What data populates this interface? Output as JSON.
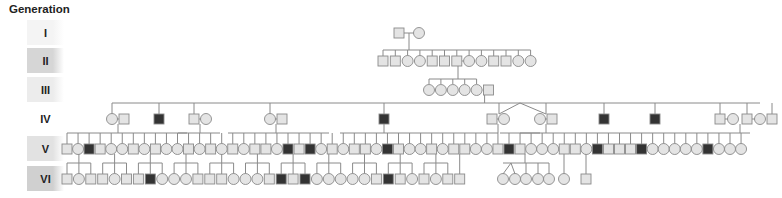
{
  "title": "Generation",
  "colors": {
    "unaffected_fill": "#e4e4e4",
    "affected_fill": "#333333",
    "line": "#8a8a8a"
  },
  "generations": [
    {
      "label": "I",
      "shade": "#f4f4f4"
    },
    {
      "label": "II",
      "shade": "#d6d6d6"
    },
    {
      "label": "III",
      "shade": "#ececec"
    },
    {
      "label": "IV",
      "shade": "#ffffff"
    },
    {
      "label": "V",
      "shade": "#e2e2e2"
    },
    {
      "label": "VI",
      "shade": "#d0d0d0"
    }
  ],
  "legend": {
    "square": "male",
    "circle": "female",
    "filled": "affected",
    "open": "unaffected"
  },
  "pedigree": {
    "gen_I": [
      "M",
      "F"
    ],
    "gen_II": [
      "M",
      "M",
      "F",
      "F",
      "M",
      "M",
      "M",
      "F",
      "F",
      "M",
      "M",
      "F",
      "F"
    ],
    "gen_III": [
      "F",
      "F",
      "F",
      "F",
      "F",
      "M"
    ],
    "gen_IV": [
      "F",
      "M",
      "A",
      "M",
      "F",
      "F",
      "M",
      "A",
      "M",
      "F",
      "F",
      "M",
      "A",
      "A",
      "M",
      "F",
      "M",
      "F",
      "M"
    ],
    "gen_V_row": [
      "M",
      "F",
      "A",
      "M",
      "F",
      "F",
      "M",
      "F",
      "M",
      "F",
      "F",
      "M",
      "F",
      "M",
      "F",
      "M",
      "F",
      "M",
      "M",
      "F",
      "A",
      "M",
      "A",
      "F",
      "M",
      "F",
      "M",
      "M",
      "F",
      "A",
      "M",
      "F",
      "F",
      "M",
      "F",
      "M",
      "M",
      "F",
      "F",
      "M",
      "A",
      "M",
      "F",
      "F",
      "F",
      "M",
      "M",
      "F",
      "A",
      "M",
      "M",
      "M",
      "A",
      "F",
      "F",
      "F",
      "F",
      "F",
      "A",
      "F",
      "F",
      "F"
    ],
    "gen_VI_row": [
      "M",
      "F",
      "M",
      "M",
      "F",
      "M",
      "M",
      "A",
      "F",
      "F",
      "F",
      "M",
      "M",
      "M",
      "F",
      "F",
      "F",
      "M",
      "A",
      "M",
      "A",
      "F",
      "F",
      "F",
      "F",
      "F",
      "M",
      "A",
      "M",
      "F",
      "M",
      "F",
      "M",
      "M"
    ],
    "gen_VI_extra": [
      "F",
      "F",
      "F",
      "F",
      "F",
      "F",
      "M"
    ]
  }
}
